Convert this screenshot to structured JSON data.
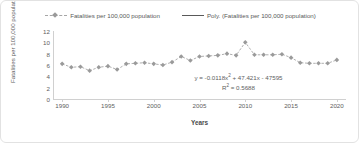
{
  "chart_data": {
    "type": "scatter",
    "title": "",
    "xlabel": "Years",
    "ylabel": "Fatalities per 100,000 population",
    "xlim": [
      1989,
      2021
    ],
    "ylim": [
      0,
      12
    ],
    "grid": false,
    "legend_position": "top-center",
    "xticks": [
      1990,
      1995,
      2000,
      2005,
      2010,
      2015,
      2020
    ],
    "yticks": [
      0,
      2,
      4,
      6,
      8,
      10,
      12
    ],
    "series": [
      {
        "name": "Fatalities per 100,000 population",
        "marker": "diamond",
        "marker_color": "#9a9a9a",
        "line_style": "dashed",
        "line_color": "#a6a6a6",
        "x": [
          1990,
          1991,
          1992,
          1993,
          1994,
          1995,
          1996,
          1997,
          1998,
          1999,
          2000,
          2001,
          2002,
          2003,
          2004,
          2005,
          2006,
          2007,
          2008,
          2009,
          2010,
          2011,
          2012,
          2013,
          2014,
          2015,
          2016,
          2017,
          2018,
          2019,
          2020
        ],
        "values": [
          6.2,
          5.6,
          5.7,
          5.0,
          5.6,
          5.8,
          5.2,
          6.2,
          6.3,
          6.4,
          6.2,
          6.0,
          6.5,
          7.5,
          6.8,
          7.5,
          7.6,
          7.7,
          8.0,
          7.7,
          10.0,
          7.8,
          7.8,
          7.8,
          7.9,
          7.3,
          6.4,
          6.3,
          6.3,
          6.3,
          6.9
        ]
      },
      {
        "name": "Poly. (Fatalities per 100,000 population)",
        "type": "trendline",
        "line_style": "solid",
        "line_color": "#595959",
        "order": 2,
        "equation": "y = -0.0118x² + 47.421x - 47595",
        "r_squared": "R² = 0.5688"
      }
    ],
    "annotations": [
      {
        "text": "y = -0.0118x² + 47.421x - 47595"
      },
      {
        "text": "R² = 0.5688"
      }
    ]
  },
  "legend": {
    "entries": [
      {
        "label": "Fatalities per 100,000 population"
      },
      {
        "label": "Poly. (Fatalities per 100,000 population)"
      }
    ]
  },
  "equation": {
    "line1_prefix": "y = -0.0118x",
    "line1_exp": "2",
    "line1_suffix": " + 47.421x - 47595",
    "line2_prefix": "R",
    "line2_exp": "2",
    "line2_suffix": " = 0.5688"
  },
  "axes": {
    "ylabel": "Fatalities per 100,000 population",
    "xlabel": "Years",
    "yticks": [
      "12",
      "10",
      "8",
      "6",
      "4",
      "2",
      "0"
    ],
    "xticks": [
      "1990",
      "1995",
      "2000",
      "2005",
      "2010",
      "2015",
      "2020"
    ]
  }
}
